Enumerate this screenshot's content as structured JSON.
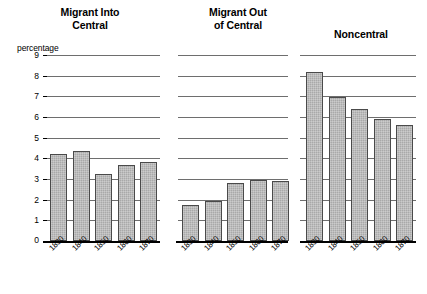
{
  "chart_data": {
    "type": "bar",
    "title": "",
    "ylabel": "percentage",
    "xlabel": "",
    "ylim": [
      0,
      9
    ],
    "yticks": [
      0,
      1,
      2,
      3,
      4,
      5,
      6,
      7,
      8,
      9
    ],
    "ytick_labels": [
      "0",
      "1",
      "2",
      "3",
      "4",
      "5",
      "6",
      "7",
      "8",
      "9"
    ],
    "grid": true,
    "legend": "none",
    "categories": [
      "1830",
      "1840",
      "1850",
      "1860",
      "1870"
    ],
    "panels": [
      {
        "title": "Migrant Into Central",
        "title_lines": [
          "Migrant Into",
          "Central"
        ],
        "categories": [
          "1830",
          "1840",
          "1850",
          "1860",
          "1870"
        ],
        "values": [
          4.2,
          4.35,
          3.25,
          3.7,
          3.8
        ]
      },
      {
        "title": "Migrant Out of Central",
        "title_lines": [
          "Migrant Out",
          "of Central"
        ],
        "categories": [
          "1830",
          "1840",
          "1850",
          "1860",
          "1870"
        ],
        "values": [
          1.75,
          1.95,
          2.8,
          2.95,
          2.9
        ]
      },
      {
        "title": "Noncentral",
        "title_lines": [
          "Noncentral"
        ],
        "categories": [
          "1830",
          "1840",
          "1850",
          "1860",
          "1870"
        ],
        "values": [
          8.2,
          6.95,
          6.4,
          5.9,
          5.6
        ]
      }
    ],
    "series": [
      {
        "name": "Migrant Into Central",
        "values": [
          4.2,
          4.35,
          3.25,
          3.7,
          3.8
        ]
      },
      {
        "name": "Migrant Out of Central",
        "values": [
          1.75,
          1.95,
          2.8,
          2.95,
          2.9
        ]
      },
      {
        "name": "Noncentral",
        "values": [
          8.2,
          6.95,
          6.4,
          5.9,
          5.6
        ]
      }
    ],
    "colors": {
      "bar_fill": "#a9a9a9",
      "bar_edge": "#4a4a4a",
      "gridline": "#6e6e6e",
      "axis": "#000000",
      "text": "#000000",
      "background": "#ffffff"
    }
  }
}
